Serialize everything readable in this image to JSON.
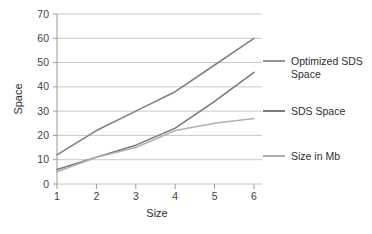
{
  "chart_data": {
    "type": "line",
    "title": "",
    "xlabel": "Size",
    "ylabel": "Space",
    "categories": [
      "1",
      "2",
      "3",
      "4",
      "5",
      "6"
    ],
    "x": [
      1,
      2,
      3,
      4,
      5,
      6
    ],
    "xlim": [
      1,
      6
    ],
    "ylim": [
      0,
      70
    ],
    "ytick_labels": [
      "0",
      "10",
      "20",
      "30",
      "40",
      "50",
      "60",
      "70"
    ],
    "yticks": [
      0,
      10,
      20,
      30,
      40,
      50,
      60,
      70
    ],
    "xtick_labels": [
      "1",
      "2",
      "3",
      "4",
      "5",
      "6"
    ],
    "grid": "horizontal",
    "legend_position": "right",
    "series": [
      {
        "name": "Optimized SDS Space",
        "color": "#808080",
        "values": [
          12,
          22,
          30,
          38,
          49,
          60
        ]
      },
      {
        "name": "SDS Space",
        "color": "#7a7a7a",
        "values": [
          6,
          11,
          16,
          23,
          34,
          46
        ]
      },
      {
        "name": "Size in Mb",
        "color": "#b0b0b0",
        "values": [
          5,
          11,
          15,
          22,
          25,
          27
        ]
      }
    ]
  },
  "axes": {
    "y_title": "Space",
    "x_title": "Size"
  },
  "legend": {
    "items": [
      {
        "label_line1": "Optimized SDS",
        "label_line2": "Space",
        "color": "#8a8a8a"
      },
      {
        "label_line1": "SDS Space",
        "label_line2": "",
        "color": "#6e6e6e"
      },
      {
        "label_line1": "Size in Mb",
        "label_line2": "",
        "color": "#a8a8a8"
      }
    ]
  },
  "colors": {
    "gridline": "#c8c8c8",
    "axis": "#9a9a9a",
    "text": "#3b3b3b",
    "background": "#ffffff"
  }
}
